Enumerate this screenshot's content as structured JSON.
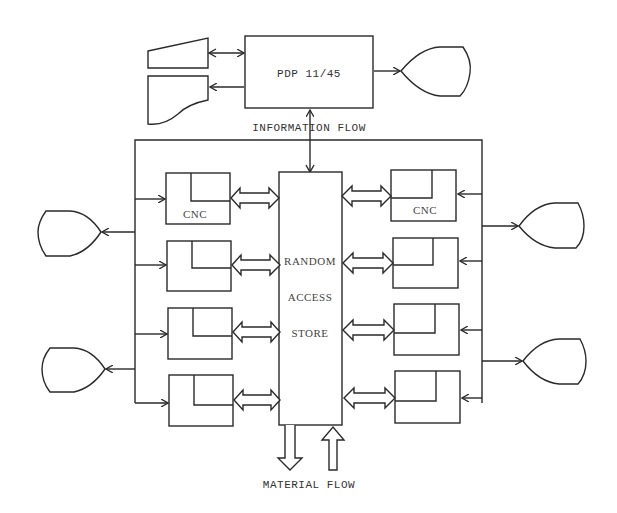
{
  "diagram": {
    "computer": {
      "label": "PDP 11/45"
    },
    "information_flow_label": "INFORMATION FLOW",
    "store": {
      "line1": "RANDOM",
      "line2": "ACCESS",
      "line3": "STORE"
    },
    "material_flow_label": "MATERIAL FLOW",
    "machines": {
      "left": [
        {
          "label": "CNC"
        },
        {
          "label": ""
        },
        {
          "label": ""
        },
        {
          "label": ""
        }
      ],
      "right": [
        {
          "label": "CNC"
        },
        {
          "label": ""
        },
        {
          "label": ""
        },
        {
          "label": ""
        }
      ]
    },
    "peripherals": {
      "top_left": [
        "keyboard-input-device",
        "card-reader-device"
      ],
      "top_right": [
        "display-terminal"
      ],
      "left": [
        "display-terminal",
        "display-terminal"
      ],
      "right": [
        "display-terminal",
        "display-terminal"
      ]
    },
    "colors": {
      "line": "#2a2a2a",
      "text": "#333333",
      "background": "#ffffff"
    }
  }
}
